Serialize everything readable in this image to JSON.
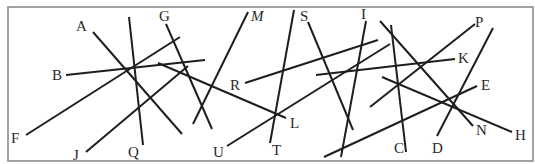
{
  "diagram": {
    "width": 535,
    "height": 164,
    "frame": {
      "x": 8,
      "y": 7,
      "w": 525,
      "h": 154,
      "color": "#8a8a8a"
    },
    "line_color": "#1e1e1e",
    "label_color": "#2a2a2a",
    "segments": [
      {
        "label": "A",
        "x1": 93,
        "y1": 32,
        "x2": 182,
        "y2": 134,
        "lx": 76,
        "ly": 31,
        "italic": false
      },
      {
        "label": "B",
        "x1": 66,
        "y1": 75,
        "x2": 205,
        "y2": 60,
        "lx": 52,
        "ly": 80,
        "italic": false
      },
      {
        "label": "F",
        "x1": 26,
        "y1": 135,
        "x2": 180,
        "y2": 37,
        "lx": 11,
        "ly": 143,
        "italic": false
      },
      {
        "label": "J",
        "x1": 86,
        "y1": 152,
        "x2": 188,
        "y2": 66,
        "lx": 73,
        "ly": 160,
        "italic": false
      },
      {
        "label": "Q",
        "x1": 129,
        "y1": 17,
        "x2": 143,
        "y2": 145,
        "lx": 128,
        "ly": 157,
        "italic": false
      },
      {
        "label": "G",
        "x1": 166,
        "y1": 24,
        "x2": 212,
        "y2": 129,
        "lx": 159,
        "ly": 21,
        "italic": false
      },
      {
        "label": "M",
        "x1": 248,
        "y1": 12,
        "x2": 193,
        "y2": 124,
        "lx": 251,
        "ly": 21,
        "italic": true
      },
      {
        "label": "L",
        "x1": 158,
        "y1": 63,
        "x2": 286,
        "y2": 118,
        "lx": 290,
        "ly": 128,
        "italic": false
      },
      {
        "label": "R",
        "x1": 245,
        "y1": 83,
        "x2": 378,
        "y2": 40,
        "lx": 230,
        "ly": 90,
        "italic": false
      },
      {
        "label": "T",
        "x1": 294,
        "y1": 10,
        "x2": 270,
        "y2": 143,
        "lx": 272,
        "ly": 155,
        "italic": false
      },
      {
        "label": "U",
        "x1": 227,
        "y1": 146,
        "x2": 390,
        "y2": 44,
        "lx": 213,
        "ly": 157,
        "italic": false
      },
      {
        "label": "S",
        "x1": 308,
        "y1": 22,
        "x2": 353,
        "y2": 130,
        "lx": 300,
        "ly": 21,
        "italic": false
      },
      {
        "label": "I",
        "x1": 366,
        "y1": 21,
        "x2": 341,
        "y2": 157,
        "lx": 361,
        "ly": 19,
        "italic": false
      },
      {
        "label": "C",
        "x1": 391,
        "y1": 25,
        "x2": 406,
        "y2": 152,
        "lx": 394,
        "ly": 153,
        "italic": false
      },
      {
        "label": "N",
        "x1": 380,
        "y1": 21,
        "x2": 473,
        "y2": 126,
        "lx": 476,
        "ly": 135,
        "italic": false
      },
      {
        "label": "K",
        "x1": 316,
        "y1": 75,
        "x2": 455,
        "y2": 59,
        "lx": 458,
        "ly": 63,
        "italic": false
      },
      {
        "label": "P",
        "x1": 370,
        "y1": 107,
        "x2": 475,
        "y2": 24,
        "lx": 475,
        "ly": 27,
        "italic": false
      },
      {
        "label": "D",
        "x1": 437,
        "y1": 136,
        "x2": 493,
        "y2": 28,
        "lx": 432,
        "ly": 153,
        "italic": false
      },
      {
        "label": "E",
        "x1": 324,
        "y1": 157,
        "x2": 477,
        "y2": 86,
        "lx": 481,
        "ly": 90,
        "italic": false
      },
      {
        "label": "H",
        "x1": 382,
        "y1": 77,
        "x2": 512,
        "y2": 132,
        "lx": 515,
        "ly": 140,
        "italic": false
      }
    ]
  }
}
